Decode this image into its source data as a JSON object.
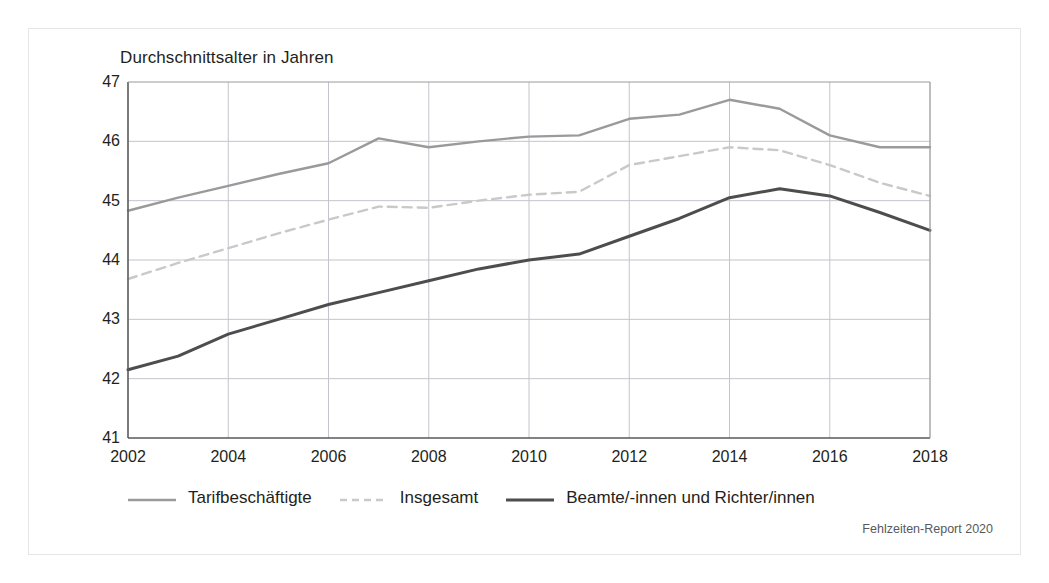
{
  "chart_data": {
    "type": "line",
    "title": "Durchschnittsalter in Jahren",
    "xlabel": "",
    "ylabel": "",
    "xlim": [
      2002,
      2018
    ],
    "ylim": [
      41,
      47
    ],
    "yticks": [
      41,
      42,
      43,
      44,
      45,
      46,
      47
    ],
    "xticks": [
      2002,
      2004,
      2006,
      2008,
      2010,
      2012,
      2014,
      2016,
      2018
    ],
    "x": [
      2002,
      2003,
      2004,
      2005,
      2006,
      2007,
      2008,
      2009,
      2010,
      2011,
      2012,
      2013,
      2014,
      2015,
      2016,
      2017,
      2018
    ],
    "grid": true,
    "legend_position": "bottom",
    "series": [
      {
        "name": "Tarifbeschäftigte",
        "color": "#9a9a9a",
        "style": "solid",
        "values": [
          44.83,
          45.05,
          45.25,
          45.45,
          45.63,
          46.05,
          45.9,
          46.0,
          46.08,
          46.1,
          46.38,
          46.45,
          46.7,
          46.55,
          46.1,
          45.9,
          45.9
        ]
      },
      {
        "name": "Insgesamt",
        "color": "#c9c9c9",
        "style": "dashed",
        "values": [
          43.68,
          43.95,
          44.2,
          44.45,
          44.68,
          44.9,
          44.88,
          45.0,
          45.1,
          45.15,
          45.6,
          45.75,
          45.9,
          45.85,
          45.6,
          45.3,
          45.08
        ]
      },
      {
        "name": "Beamte/-innen und Richter/innen",
        "color": "#4d4d4d",
        "style": "solid",
        "values": [
          42.15,
          42.38,
          42.75,
          43.0,
          43.25,
          43.45,
          43.65,
          43.85,
          44.0,
          44.1,
          44.4,
          44.7,
          45.05,
          45.2,
          45.08,
          44.8,
          44.5
        ]
      }
    ]
  },
  "footer": {
    "note": "Fehlzeiten-Report 2020"
  },
  "colors": {
    "text": "#231f20",
    "grid": "#c4c4cc",
    "axis": "#58595b",
    "frame": "#e6e6e6",
    "background": "#ffffff"
  }
}
